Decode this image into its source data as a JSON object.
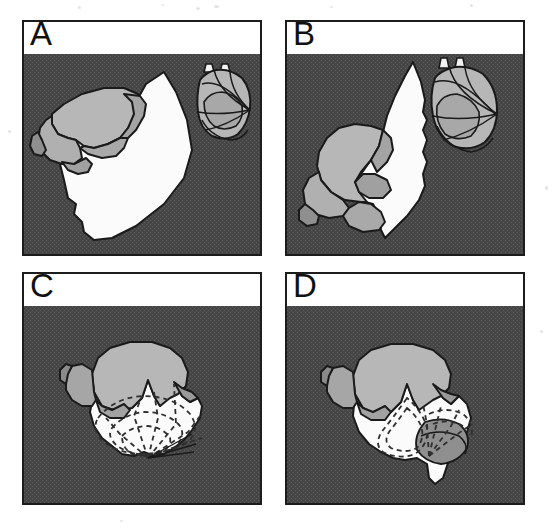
{
  "figure": {
    "type": "multi-panel-scientific-figure",
    "layout": "2x2",
    "background": "#ffffff",
    "panel_border_color": "#1c1c1c",
    "panel_header_background": "#ffffff"
  },
  "palette": {
    "background_dark_gray": "#4a4a4a",
    "background_dither_light": "#5c5c5c",
    "light_gray_fill": "#b5b5b5",
    "mid_gray_fill": "#9a9a9a",
    "white_fill": "#fbfbfb",
    "outline_black": "#1a1a1a",
    "dashed_line": "#3a3a3a"
  },
  "panels": [
    {
      "id": "A",
      "label": "A",
      "position": "top-left",
      "rect": {
        "x": 22,
        "y": 20,
        "w": 240,
        "h": 236
      },
      "shapes": {
        "light_gray_mass": "upper-left lobed mass",
        "white_mass": "large white wedge occupying center and lower area",
        "side_structure": "small rounded capsule with curved line overlays at right, two small projections on top"
      },
      "dashed_contours": false
    },
    {
      "id": "B",
      "label": "B",
      "position": "top-right",
      "rect": {
        "x": 285,
        "y": 20,
        "w": 240,
        "h": 236
      },
      "shapes": {
        "light_gray_mass": "lower-left lobed mass",
        "white_mass": "tall white wedge through the center",
        "side_structure": "small rounded capsule with curved line overlays at upper right, two small projections on top"
      },
      "dashed_contours": false
    },
    {
      "id": "C",
      "label": "C",
      "position": "bottom-left",
      "rect": {
        "x": 22,
        "y": 272,
        "w": 240,
        "h": 233
      },
      "shapes": {
        "light_gray_mass": "upper lobed mass",
        "white_mass": "lower white spiked mass",
        "side_structure": "none"
      },
      "dashed_contours": true,
      "dashed_description": "concentric dashed ellipses with radiating dashed lines converging at a lower point"
    },
    {
      "id": "D",
      "label": "D",
      "position": "bottom-right",
      "rect": {
        "x": 285,
        "y": 272,
        "w": 240,
        "h": 233
      },
      "shapes": {
        "light_gray_mass": "upper lobed mass",
        "white_mass": "lower white spiked mass with downward tail",
        "mid_gray_wedge": "shaded crescent wedge at lower right"
      },
      "dashed_contours": true,
      "dashed_description": "dashed teardrop contour at center-left and dashed fan of lines at right"
    }
  ]
}
